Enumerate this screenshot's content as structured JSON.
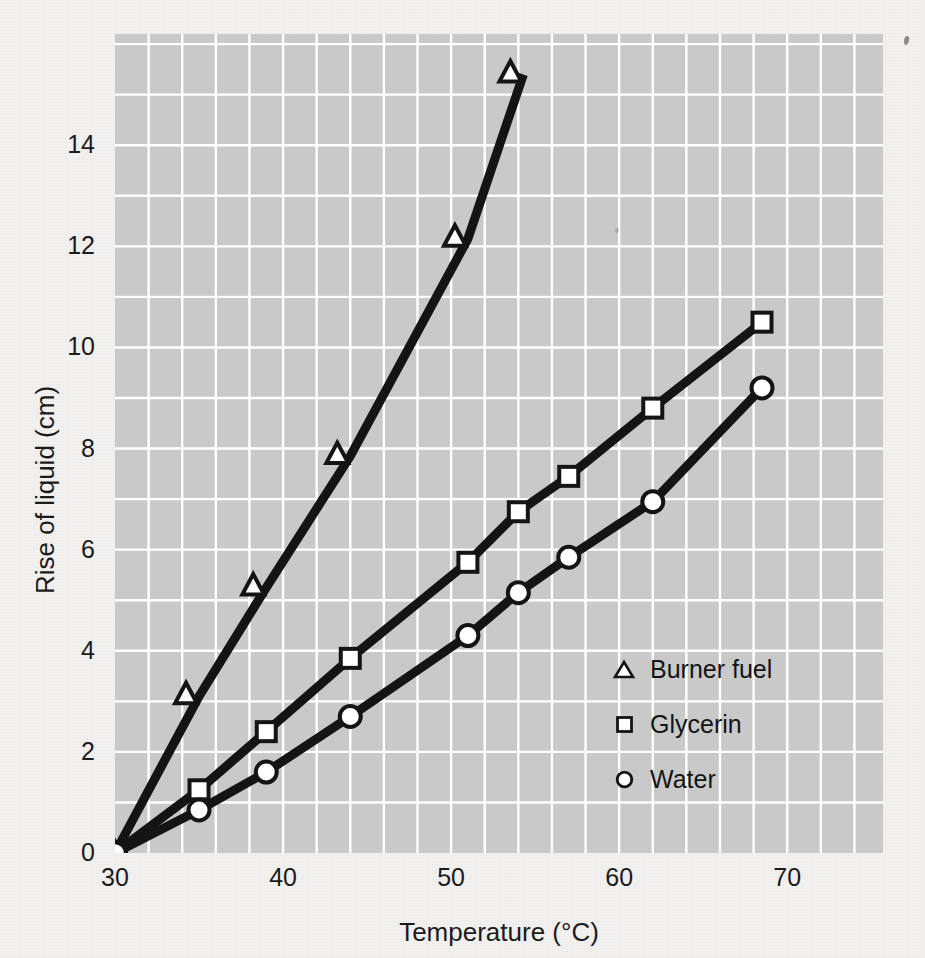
{
  "chart_data": {
    "type": "line",
    "title": "",
    "subtitle": "",
    "xlabel": "Temperature (°C)",
    "ylabel": "Rise of liquid (cm)",
    "xlim": [
      30,
      75.7
    ],
    "ylim": [
      0,
      16.2
    ],
    "xticks": [
      30,
      40,
      50,
      60,
      70
    ],
    "yticks": [
      0,
      2,
      4,
      6,
      8,
      10,
      12,
      14
    ],
    "xtick_labels": [
      "30",
      "40",
      "50",
      "60",
      "70"
    ],
    "ytick_labels": [
      "0",
      "2",
      "4",
      "6",
      "8",
      "10",
      "12",
      "14"
    ],
    "x_minor_step": 2,
    "y_minor_step": 1,
    "grid": true,
    "grid_color": "#ffffff",
    "plot_bg_color": "#c9c9c9",
    "figure_bg_color": "#f2f1ef",
    "line_color": "#141414",
    "marker_face_color": "#ffffff",
    "legend_position": "inside-lower-right",
    "series": [
      {
        "name": "Burner fuel",
        "marker": "triangle",
        "x": [
          30,
          35,
          39,
          44,
          51,
          54.3
        ],
        "y": [
          0,
          3.1,
          5.25,
          7.85,
          12.15,
          15.4
        ]
      },
      {
        "name": "Glycerin",
        "marker": "square",
        "x": [
          30,
          35,
          39,
          44,
          51,
          54,
          57,
          62,
          68.5
        ],
        "y": [
          0,
          1.25,
          2.4,
          3.85,
          5.75,
          6.75,
          7.45,
          8.8,
          10.5
        ]
      },
      {
        "name": "Water",
        "marker": "circle",
        "x": [
          30,
          35,
          39,
          44,
          51,
          54,
          57,
          62,
          68.5
        ],
        "y": [
          0,
          0.85,
          1.6,
          2.7,
          4.3,
          5.15,
          5.85,
          6.95,
          9.2
        ]
      }
    ]
  },
  "axes": {
    "x_title": "Temperature (°C)",
    "y_title": "Rise of liquid (cm)",
    "x_tick_labels": [
      "30",
      "40",
      "50",
      "60",
      "70"
    ],
    "y_tick_labels": [
      "0",
      "2",
      "4",
      "6",
      "8",
      "10",
      "12",
      "14"
    ]
  },
  "legend": {
    "items": [
      {
        "label": "Burner fuel",
        "marker": "triangle-marker-icon"
      },
      {
        "label": "Glycerin",
        "marker": "square-marker-icon"
      },
      {
        "label": "Water",
        "marker": "circle-marker-icon"
      }
    ]
  }
}
